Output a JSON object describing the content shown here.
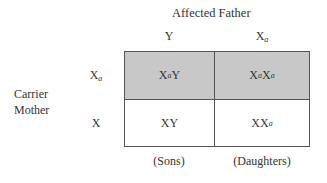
{
  "title": "Affected Father",
  "father_alleles": [
    "Y",
    "X_a"
  ],
  "mother_label_line1": "Carrier",
  "mother_label_line2": "Mother",
  "mother_alleles": [
    "X_a",
    "X"
  ],
  "cells": [
    [
      "X_aY",
      "X_aX_a"
    ],
    [
      "XY",
      "XX_a"
    ]
  ],
  "shaded_rows": [
    0
  ],
  "footers": [
    "(Sons)",
    "(Daughters)"
  ],
  "colors": {
    "shade": "#c8c8c8",
    "border": "#555555"
  }
}
